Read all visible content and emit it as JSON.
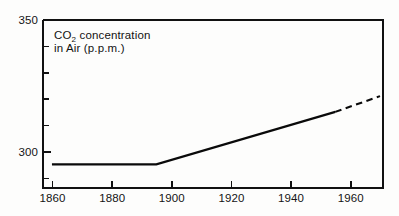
{
  "chart_data": {
    "type": "line",
    "title": "CO2 concentration in Air (p.p.m.)",
    "title_line1_pre": "CO",
    "title_line1_sub": "2",
    "title_line1_post": " concentration",
    "title_line2": "in Air (p.p.m.)",
    "xlabel": "",
    "ylabel": "",
    "xlim": [
      1862,
      1976
    ],
    "ylim": [
      286,
      350
    ],
    "xticks": [
      1860,
      1880,
      1900,
      1920,
      1940,
      1960
    ],
    "xtick_labels": [
      "1860",
      "1880",
      "1900",
      "1920",
      "1940",
      "1960"
    ],
    "yticks": [
      300,
      350
    ],
    "ytick_labels": [
      "300",
      "350"
    ],
    "y_minor_ticks": [
      290,
      310,
      320,
      330,
      340
    ],
    "grid": false,
    "legend": "none",
    "series": [
      {
        "name": "Observed CO2 concentration",
        "style": "solid",
        "x": [
          1865,
          1900,
          1960
        ],
        "values": [
          295,
          295,
          315
        ]
      },
      {
        "name": "Projected CO2 concentration",
        "style": "dashed",
        "x": [
          1960,
          1975
        ],
        "values": [
          315,
          321
        ]
      }
    ],
    "annotations": [
      {
        "name": "dash-transition",
        "text": "solid line becomes dashed at 1960"
      }
    ],
    "colors": {
      "line": "#0a0a0a",
      "axis": "#111111",
      "background": "#fdfdfc",
      "text": "#141414"
    }
  }
}
